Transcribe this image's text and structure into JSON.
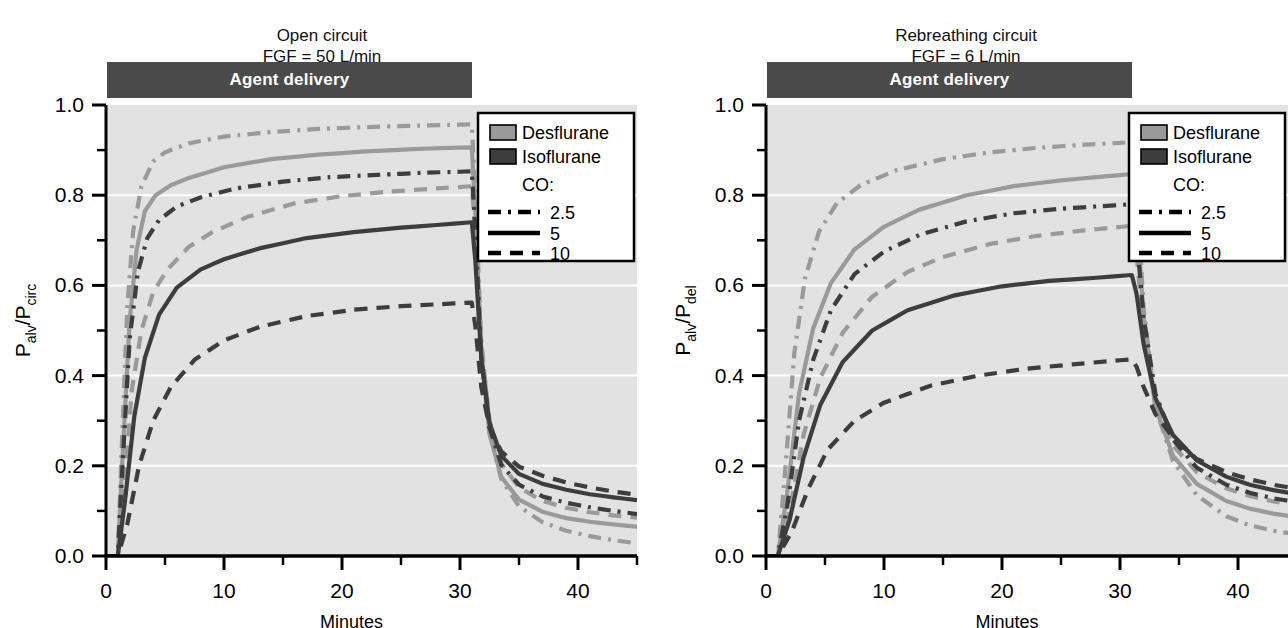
{
  "figure": {
    "background": "#ffffff",
    "plot_background": "#e2e2e2",
    "gridline_color": "#ffffff",
    "axis_color": "#000000",
    "desflurane_color": "#9a9a9a",
    "isoflurane_color": "#3d3d3d",
    "agent_bar_color": "#4a4a4a",
    "agent_bar_label": "Agent delivery"
  },
  "panels": [
    {
      "id": "open-circuit",
      "title_line1": "Open circuit",
      "title_line2": "FGF = 50 L/min",
      "ylabel_main": "P",
      "ylabel_sub1": "alv",
      "ylabel_slash": "/P",
      "ylabel_sub2": "circ",
      "xlabel": "Minutes",
      "legend": {
        "desflurane_label": "Desflurane",
        "isoflurane_label": "Isoflurane",
        "co_label": "CO:",
        "co_items": [
          "2.5",
          "5",
          "10"
        ]
      },
      "chart_data": {
        "type": "line",
        "title": "Open circuit FGF = 50 L/min",
        "xlabel": "Minutes",
        "ylabel": "Palv/Pcirc",
        "xlim": [
          0,
          45
        ],
        "ylim": [
          0,
          1.0
        ],
        "xticks": [
          0,
          10,
          20,
          30,
          40
        ],
        "xticks_minor": [
          5,
          15,
          25,
          35,
          45
        ],
        "yticks": [
          0.0,
          0.2,
          0.4,
          0.6,
          0.8,
          1.0
        ],
        "yticks_minor": [
          0.1,
          0.3,
          0.5,
          0.7,
          0.9
        ],
        "grid": "horizontal-white",
        "legend_position": "top-right",
        "annotations": [
          {
            "text": "Agent delivery",
            "x_start": 0,
            "x_end": 31,
            "y": 1.05
          }
        ],
        "series": [
          {
            "name": "Desflurane CO 2.5",
            "agent": "Desflurane",
            "co": 2.5,
            "color": "#9a9a9a",
            "dash": "dashdot",
            "x": [
              0,
              1,
              1.3,
              1.8,
              2.3,
              3,
              4,
              5,
              7,
              10,
              14,
              18,
              22,
              26,
              29,
              31,
              31.3,
              31.8,
              32.5,
              33.5,
              35,
              37,
              39,
              41,
              43,
              45
            ],
            "y": [
              0,
              0,
              0.22,
              0.55,
              0.72,
              0.82,
              0.875,
              0.895,
              0.915,
              0.93,
              0.94,
              0.947,
              0.951,
              0.954,
              0.956,
              0.957,
              0.8,
              0.48,
              0.28,
              0.17,
              0.11,
              0.075,
              0.056,
              0.044,
              0.035,
              0.028
            ]
          },
          {
            "name": "Desflurane CO 5",
            "agent": "Desflurane",
            "co": 5,
            "color": "#9a9a9a",
            "dash": "solid",
            "x": [
              0,
              1,
              1.4,
              2,
              2.6,
              3.3,
              4.2,
              5.5,
              7,
              10,
              14,
              18,
              22,
              26,
              29,
              31,
              31.3,
              31.8,
              32.5,
              33.5,
              35,
              37,
              39,
              41,
              43,
              45
            ],
            "y": [
              0,
              0,
              0.22,
              0.52,
              0.68,
              0.765,
              0.8,
              0.822,
              0.838,
              0.862,
              0.88,
              0.89,
              0.897,
              0.902,
              0.905,
              0.906,
              0.76,
              0.45,
              0.27,
              0.175,
              0.125,
              0.098,
              0.084,
              0.076,
              0.07,
              0.065
            ]
          },
          {
            "name": "Desflurane CO 10",
            "agent": "Desflurane",
            "co": 10,
            "color": "#9a9a9a",
            "dash": "dashed",
            "x": [
              0,
              1,
              1.5,
              2.2,
              3,
              4,
              5.2,
              7,
              9,
              12,
              16,
              20,
              24,
              28,
              31,
              31.3,
              31.8,
              32.5,
              33.5,
              35,
              37,
              39,
              41,
              43,
              45
            ],
            "y": [
              0,
              0,
              0.14,
              0.37,
              0.5,
              0.585,
              0.635,
              0.685,
              0.718,
              0.752,
              0.782,
              0.798,
              0.808,
              0.815,
              0.82,
              0.72,
              0.47,
              0.3,
              0.205,
              0.152,
              0.122,
              0.107,
              0.097,
              0.09,
              0.085
            ]
          },
          {
            "name": "Isoflurane CO 2.5",
            "agent": "Isoflurane",
            "co": 2.5,
            "color": "#3d3d3d",
            "dash": "dashdot",
            "x": [
              0,
              1,
              1.4,
              2,
              2.7,
              3.5,
              4.5,
              6,
              8,
              11,
              15,
              19,
              23,
              27,
              30,
              31,
              31.3,
              31.8,
              32.5,
              33.5,
              35,
              37,
              39,
              41,
              43,
              45
            ],
            "y": [
              0,
              0,
              0.2,
              0.48,
              0.63,
              0.705,
              0.745,
              0.775,
              0.795,
              0.815,
              0.83,
              0.84,
              0.845,
              0.85,
              0.852,
              0.853,
              0.72,
              0.44,
              0.285,
              0.202,
              0.158,
              0.132,
              0.118,
              0.108,
              0.1,
              0.093
            ]
          },
          {
            "name": "Isoflurane CO 5",
            "agent": "Isoflurane",
            "co": 5,
            "color": "#3d3d3d",
            "dash": "solid",
            "x": [
              0,
              1,
              1.6,
              2.4,
              3.3,
              4.5,
              6,
              8,
              10,
              13,
              17,
              21,
              25,
              28,
              31,
              31.3,
              31.8,
              32.5,
              33.5,
              35,
              37,
              39,
              41,
              43,
              45
            ],
            "y": [
              0,
              0,
              0.12,
              0.31,
              0.44,
              0.535,
              0.595,
              0.635,
              0.658,
              0.682,
              0.705,
              0.718,
              0.728,
              0.734,
              0.74,
              0.655,
              0.44,
              0.295,
              0.222,
              0.182,
              0.16,
              0.147,
              0.137,
              0.13,
              0.124
            ]
          },
          {
            "name": "Isoflurane CO 10",
            "agent": "Isoflurane",
            "co": 10,
            "color": "#3d3d3d",
            "dash": "dashed",
            "x": [
              0,
              1,
              1.8,
              2.8,
              4,
              5.5,
              7.5,
              10,
              13,
              17,
              21,
              25,
              28,
              31,
              31.3,
              31.8,
              32.5,
              33.5,
              35,
              37,
              39,
              41,
              43,
              45
            ],
            "y": [
              0,
              0,
              0.07,
              0.2,
              0.3,
              0.375,
              0.435,
              0.478,
              0.508,
              0.532,
              0.546,
              0.554,
              0.558,
              0.562,
              0.51,
              0.375,
              0.285,
              0.232,
              0.198,
              0.178,
              0.163,
              0.152,
              0.143,
              0.136
            ]
          }
        ]
      }
    },
    {
      "id": "rebreathing-circuit",
      "title_line1": "Rebreathing circuit",
      "title_line2": "FGF = 6 L/min",
      "ylabel_main": "P",
      "ylabel_sub1": "alv",
      "ylabel_slash": "/P",
      "ylabel_sub2": "del",
      "xlabel": "Minutes",
      "legend": {
        "desflurane_label": "Desflurane",
        "isoflurane_label": "Isoflurane",
        "co_label": "CO:",
        "co_items": [
          "2.5",
          "5",
          "10"
        ]
      },
      "chart_data": {
        "type": "line",
        "title": "Rebreathing circuit FGF = 6 L/min",
        "xlabel": "Minutes",
        "ylabel": "Palv/Pdel",
        "xlim": [
          0,
          45
        ],
        "ylim": [
          0,
          1.0
        ],
        "xticks": [
          0,
          10,
          20,
          30,
          40
        ],
        "xticks_minor": [
          5,
          15,
          25,
          35,
          45
        ],
        "yticks": [
          0.0,
          0.2,
          0.4,
          0.6,
          0.8,
          1.0
        ],
        "yticks_minor": [
          0.1,
          0.3,
          0.5,
          0.7,
          0.9
        ],
        "grid": "horizontal-white",
        "legend_position": "top-right",
        "annotations": [
          {
            "text": "Agent delivery",
            "x_start": 0,
            "x_end": 31,
            "y": 1.05
          }
        ],
        "series": [
          {
            "name": "Desflurane CO 2.5",
            "agent": "Desflurane",
            "co": 2.5,
            "color": "#9a9a9a",
            "dash": "dashdot",
            "x": [
              0,
              1,
              1.6,
              2.4,
              3.3,
              4.5,
              6,
              8,
              11,
              15,
              19,
              23,
              27,
              30,
              31,
              31.4,
              32,
              33,
              34.5,
              36.5,
              39,
              41,
              43,
              45
            ],
            "y": [
              0,
              0,
              0.18,
              0.45,
              0.615,
              0.72,
              0.782,
              0.822,
              0.855,
              0.88,
              0.895,
              0.905,
              0.912,
              0.916,
              0.918,
              0.82,
              0.55,
              0.33,
              0.21,
              0.135,
              0.088,
              0.068,
              0.056,
              0.048
            ]
          },
          {
            "name": "Desflurane CO 5",
            "agent": "Desflurane",
            "co": 5,
            "color": "#9a9a9a",
            "dash": "solid",
            "x": [
              0,
              1,
              1.8,
              2.8,
              4,
              5.5,
              7.5,
              10,
              13,
              17,
              21,
              25,
              28,
              31,
              31.4,
              32,
              33,
              34.5,
              36.5,
              39,
              41,
              43,
              45
            ],
            "y": [
              0,
              0,
              0.14,
              0.36,
              0.505,
              0.605,
              0.68,
              0.73,
              0.768,
              0.8,
              0.82,
              0.833,
              0.84,
              0.847,
              0.76,
              0.53,
              0.33,
              0.222,
              0.16,
              0.122,
              0.105,
              0.094,
              0.086
            ]
          },
          {
            "name": "Desflurane CO 10",
            "agent": "Desflurane",
            "co": 10,
            "color": "#9a9a9a",
            "dash": "dashed",
            "x": [
              0,
              1,
              2,
              3.2,
              4.6,
              6.5,
              9,
              12,
              15,
              19,
              23,
              27,
              29,
              31,
              31.4,
              32,
              33,
              34.5,
              36.5,
              39,
              41,
              43,
              45
            ],
            "y": [
              0,
              0,
              0.1,
              0.27,
              0.395,
              0.495,
              0.575,
              0.63,
              0.663,
              0.692,
              0.71,
              0.722,
              0.727,
              0.732,
              0.67,
              0.5,
              0.34,
              0.245,
              0.186,
              0.15,
              0.133,
              0.121,
              0.113
            ]
          },
          {
            "name": "Isoflurane CO 2.5",
            "agent": "Isoflurane",
            "co": 2.5,
            "color": "#3d3d3d",
            "dash": "dashdot",
            "x": [
              0,
              1,
              1.8,
              2.8,
              4,
              5.5,
              7.5,
              10,
              13,
              17,
              21,
              25,
              28,
              31,
              31.4,
              32,
              33,
              34.5,
              36.5,
              39,
              41,
              43,
              45
            ],
            "y": [
              0,
              0,
              0.11,
              0.3,
              0.435,
              0.545,
              0.625,
              0.675,
              0.712,
              0.742,
              0.76,
              0.77,
              0.775,
              0.78,
              0.71,
              0.53,
              0.36,
              0.258,
              0.196,
              0.158,
              0.14,
              0.128,
              0.119
            ]
          },
          {
            "name": "Isoflurane CO 5",
            "agent": "Isoflurane",
            "co": 5,
            "color": "#3d3d3d",
            "dash": "solid",
            "x": [
              0,
              1,
              2,
              3.2,
              4.6,
              6.5,
              9,
              12,
              16,
              20,
              24,
              28,
              31,
              31.4,
              32,
              33,
              34.5,
              36.5,
              39,
              41,
              43,
              45
            ],
            "y": [
              0,
              0,
              0.08,
              0.22,
              0.335,
              0.43,
              0.5,
              0.545,
              0.578,
              0.598,
              0.61,
              0.617,
              0.623,
              0.582,
              0.47,
              0.35,
              0.268,
              0.212,
              0.176,
              0.158,
              0.146,
              0.137
            ]
          },
          {
            "name": "Isoflurane CO 10",
            "agent": "Isoflurane",
            "co": 10,
            "color": "#3d3d3d",
            "dash": "dashed",
            "x": [
              0,
              1,
              2.2,
              3.6,
              5.2,
              7.5,
              10,
              14,
              18,
              22,
              26,
              29,
              31,
              31.4,
              32,
              33,
              34.5,
              36.5,
              39,
              41,
              43,
              45
            ],
            "y": [
              0,
              0,
              0.055,
              0.15,
              0.235,
              0.3,
              0.34,
              0.378,
              0.4,
              0.415,
              0.425,
              0.432,
              0.436,
              0.42,
              0.375,
              0.315,
              0.262,
              0.215,
              0.186,
              0.17,
              0.158,
              0.149
            ]
          }
        ]
      }
    }
  ]
}
